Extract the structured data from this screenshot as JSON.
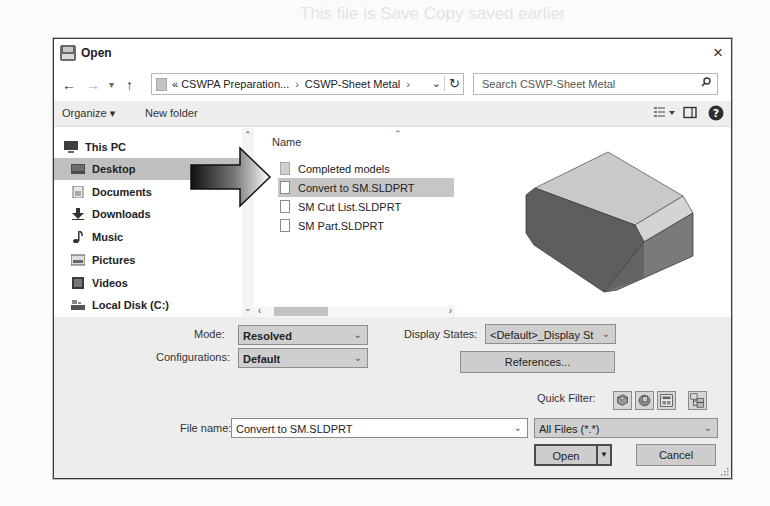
{
  "dialog": {
    "title": "Open",
    "close_label": "×"
  },
  "navbar": {
    "back": "←",
    "forward": "→",
    "recent": "▾",
    "up": "↑",
    "breadcrumb": [
      "« CSWPA Preparation...",
      "CSWP-Sheet Metal"
    ],
    "breadcrumb_separator": "›",
    "search_placeholder": "Search CSWP-Sheet Metal"
  },
  "toolbar": {
    "organize_label": "Organize ▾",
    "new_folder_label": "New folder"
  },
  "nav_pane": {
    "items": [
      {
        "label": "This PC",
        "icon": "computer-icon",
        "indent": 0,
        "selected": false
      },
      {
        "label": "Desktop",
        "icon": "desktop-icon",
        "indent": 1,
        "selected": true
      },
      {
        "label": "Documents",
        "icon": "documents-icon",
        "indent": 1,
        "selected": false
      },
      {
        "label": "Downloads",
        "icon": "download-icon",
        "indent": 1,
        "selected": false
      },
      {
        "label": "Music",
        "icon": "music-icon",
        "indent": 1,
        "selected": false
      },
      {
        "label": "Pictures",
        "icon": "pictures-icon",
        "indent": 1,
        "selected": false
      },
      {
        "label": "Videos",
        "icon": "videos-icon",
        "indent": 1,
        "selected": false
      },
      {
        "label": "Local Disk (C:)",
        "icon": "drive-icon",
        "indent": 1,
        "selected": false
      }
    ]
  },
  "file_list": {
    "column_header": "Name",
    "files": [
      {
        "name": "Completed models",
        "type": "folder",
        "selected": false
      },
      {
        "name": "Convert to SM.SLDPRT",
        "type": "part",
        "selected": true
      },
      {
        "name": "SM Cut List.SLDPRT",
        "type": "part",
        "selected": false
      },
      {
        "name": "SM Part.SLDPRT",
        "type": "part",
        "selected": false
      }
    ]
  },
  "options": {
    "mode_label": "Mode:",
    "mode_value": "Resolved",
    "configurations_label": "Configurations:",
    "configurations_value": "Default",
    "display_states_label": "Display States:",
    "display_states_value": "<Default>_Display St",
    "references_label": "References...",
    "quick_filter_label": "Quick Filter:"
  },
  "footer": {
    "file_name_label": "File name:",
    "file_name_value": "Convert to SM.SLDPRT",
    "file_type_value": "All Files (*.*)",
    "open_label": "Open",
    "cancel_label": "Cancel"
  }
}
